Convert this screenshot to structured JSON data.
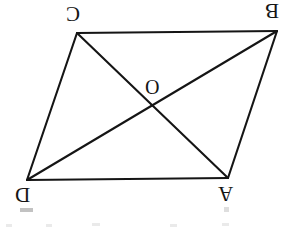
{
  "figure": {
    "kind": "geometry-diagram",
    "shape_name": "parallelogram-with-diagonals",
    "background_color": "#ffffff",
    "stroke_color": "#151515",
    "stroke_width": 2.1,
    "label_rotation_degrees": 180,
    "canvas": {
      "width": 282,
      "height": 230
    }
  },
  "labels": {
    "vertex_c": "C",
    "vertex_b": "B",
    "vertex_d": "D",
    "vertex_a": "A",
    "center_o": "O"
  },
  "geometry": {
    "points": {
      "C": {
        "x": 77,
        "y": 33
      },
      "B": {
        "x": 277,
        "y": 31
      },
      "A": {
        "x": 228,
        "y": 178
      },
      "D": {
        "x": 27,
        "y": 180
      },
      "O": {
        "x": 152,
        "y": 107
      }
    },
    "sides": [
      {
        "name": "CB",
        "from": "C",
        "to": "B"
      },
      {
        "name": "BA",
        "from": "B",
        "to": "A"
      },
      {
        "name": "AD",
        "from": "A",
        "to": "D"
      },
      {
        "name": "DC",
        "from": "D",
        "to": "C"
      }
    ],
    "diagonals": [
      {
        "name": "CA",
        "from": "C",
        "to": "A"
      },
      {
        "name": "DB",
        "from": "D",
        "to": "B"
      }
    ]
  }
}
